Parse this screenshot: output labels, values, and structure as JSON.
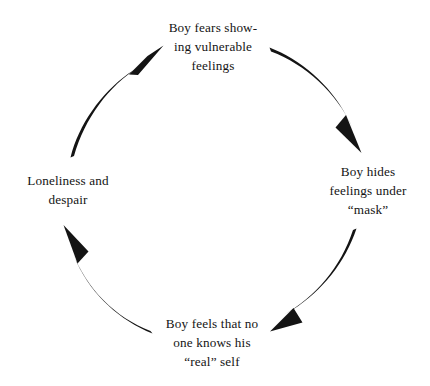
{
  "diagram": {
    "type": "cycle",
    "direction": "clockwise",
    "background_color": "#ffffff",
    "stroke_color": "#141414",
    "nodes": [
      {
        "id": "fears-showing",
        "position": "top",
        "text": "Boy fears show-\ning vulnerable\nfeelings",
        "lines": [
          "Boy fears show-",
          "ing vulnerable",
          "feelings"
        ]
      },
      {
        "id": "hides-under-mask",
        "position": "right",
        "text": "Boy hides\nfeelings under\n“mask”",
        "lines": [
          "Boy hides",
          "feelings under",
          "“mask”"
        ]
      },
      {
        "id": "no-one-knows",
        "position": "bottom",
        "text": "Boy feels that no\none knows his\n“real” self",
        "lines": [
          "Boy feels that no",
          "one knows his",
          "“real” self"
        ]
      },
      {
        "id": "loneliness-despair",
        "position": "left",
        "text": "Loneliness and\ndespair",
        "lines": [
          "Loneliness and",
          "despair"
        ]
      }
    ],
    "arrows": [
      {
        "id": "top-to-right",
        "from": "fears-showing",
        "to": "hides-under-mask"
      },
      {
        "id": "right-to-bottom",
        "from": "hides-under-mask",
        "to": "no-one-knows"
      },
      {
        "id": "bottom-to-left",
        "from": "no-one-knows",
        "to": "loneliness-despair"
      },
      {
        "id": "left-to-top",
        "from": "loneliness-despair",
        "to": "fears-showing"
      }
    ]
  }
}
